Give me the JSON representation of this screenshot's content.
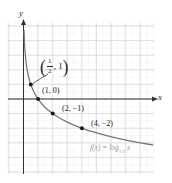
{
  "chart_data": {
    "type": "line",
    "title": "",
    "function_label": "f(x) = log1/2 x",
    "function_label_parts": {
      "prefix": "f(x) = log",
      "base": "1/2",
      "arg": " x"
    },
    "xlabel": "x",
    "ylabel": "y",
    "xlim": [
      -1,
      9
    ],
    "ylim": [
      -5,
      5
    ],
    "grid": true,
    "legend": "none",
    "series": [
      {
        "name": "f(x) = log_{1/2} x",
        "color": "#777777",
        "x": [
          0.05,
          0.125,
          0.25,
          0.5,
          1,
          2,
          4,
          8.8
        ],
        "y": [
          4.32,
          3,
          2,
          1,
          0,
          -1,
          -2,
          -3.14
        ]
      }
    ],
    "marked_points": [
      {
        "x": 0.5,
        "y": 1,
        "label": "(1/2, 1)",
        "label_num": "1",
        "label_den": "2",
        "label_y": "1"
      },
      {
        "x": 1,
        "y": 0,
        "label": "(1, 0)"
      },
      {
        "x": 2,
        "y": -1,
        "label": "(2, −1)"
      },
      {
        "x": 4,
        "y": -2,
        "label": "(4, −2)"
      }
    ],
    "colors": {
      "grid_major": "#d9d9d9",
      "grid_minor": "#eeeeee",
      "axis": "#333333",
      "curve": "#777777",
      "point": "#1a1a1a",
      "function_label": "#9a9a9a"
    }
  }
}
